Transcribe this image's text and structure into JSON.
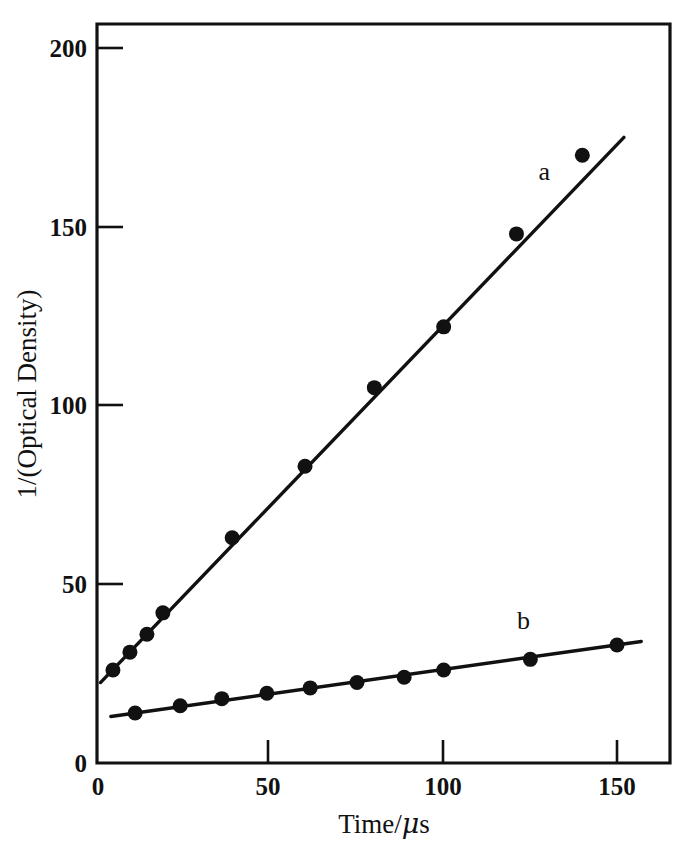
{
  "chart_data": {
    "type": "scatter",
    "title": "",
    "xlabel": "Time/μs",
    "ylabel": "1/(Optical Density)",
    "xlim": [
      0,
      165
    ],
    "ylim": [
      0,
      206
    ],
    "xticks": [
      0,
      50,
      100,
      150
    ],
    "yticks": [
      0,
      50,
      100,
      150,
      200
    ],
    "xtick_labels": [
      "0",
      "50",
      "100",
      "150"
    ],
    "ytick_labels": [
      "0",
      "50",
      "100",
      "150",
      "200"
    ],
    "grid": false,
    "legend": "inline-labels",
    "series": [
      {
        "name": "a",
        "label": "a",
        "label_x": 129,
        "label_y": 163,
        "marker": "filled-circle",
        "fit_line": {
          "x0": 1.0,
          "y0": 22.5,
          "x1": 152.0,
          "y1": 175.0
        },
        "x": [
          4.6,
          9.5,
          14.4,
          19.0,
          39.0,
          60.0,
          80.0,
          100.0,
          121.0,
          140.0
        ],
        "y": [
          26.0,
          31.0,
          36.0,
          42.0,
          63.0,
          83.0,
          105.0,
          122.0,
          148.0,
          170.0
        ]
      },
      {
        "name": "b",
        "label": "b",
        "label_x": 123,
        "label_y": 37.5,
        "marker": "filled-circle",
        "fit_line": {
          "x0": 4.0,
          "y0": 13.0,
          "x1": 157.0,
          "y1": 34.0
        },
        "x": [
          11.0,
          24.0,
          36.0,
          49.0,
          61.5,
          75.0,
          88.6,
          100.0,
          125.0,
          150.0
        ],
        "y": [
          14.0,
          16.0,
          18.0,
          19.5,
          21.0,
          22.5,
          24.0,
          26.0,
          29.0,
          33.0
        ]
      }
    ]
  },
  "axes": {
    "origin_label": "0",
    "y_axis_title": "1/(Optical Density)",
    "x_axis_title_prefix": "Time/",
    "x_axis_title_unit": "μ",
    "x_axis_title_suffix": "s"
  }
}
